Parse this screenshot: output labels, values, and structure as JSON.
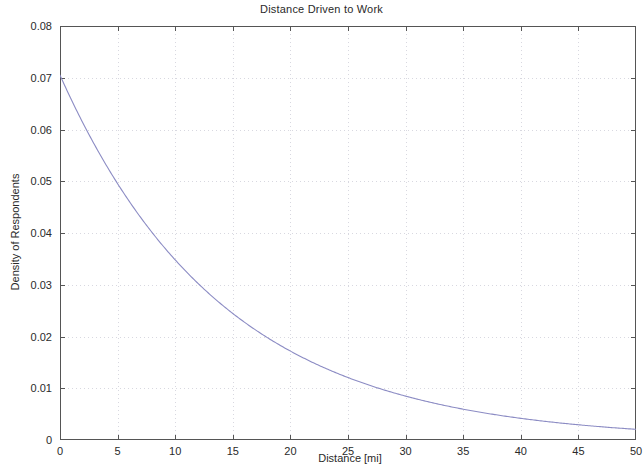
{
  "chart_data": {
    "type": "line",
    "title": "Distance Driven to Work",
    "xlabel": "Distance [mi]",
    "ylabel": "Density of Respondents",
    "xlim": [
      0,
      50
    ],
    "ylim": [
      0,
      0.08
    ],
    "xticks": [
      0,
      5,
      10,
      15,
      20,
      25,
      30,
      35,
      40,
      45,
      50
    ],
    "xtick_labels": [
      "0",
      "5",
      "10",
      "15",
      "20",
      "25",
      "30",
      "35",
      "40",
      "45",
      "50"
    ],
    "yticks": [
      0,
      0.01,
      0.02,
      0.03,
      0.04,
      0.05,
      0.06,
      0.07,
      0.08
    ],
    "ytick_labels": [
      "0",
      "0.01",
      "0.02",
      "0.03",
      "0.04",
      "0.05",
      "0.06",
      "0.07",
      "0.08"
    ],
    "grid": true,
    "grid_style": "dotted",
    "legend": null,
    "line_color": "#8c8cc4",
    "grid_color": "#d8d8e0",
    "axis_color": "#555555",
    "background": "#ffffff",
    "series": [
      {
        "name": "Exponential density fit",
        "description": "Exponential probability density of commute distance, f(x) = 0.0705 * exp(-0.0706 x)",
        "amplitude": 0.0705,
        "decay_rate": 0.0706,
        "mean_distance": 14.2,
        "x": [
          0,
          1,
          2,
          3,
          4,
          5,
          6,
          7,
          8,
          9,
          10,
          11,
          12,
          13,
          14,
          15,
          16,
          17,
          18,
          19,
          20,
          21,
          22,
          23,
          24,
          25,
          26,
          27,
          28,
          29,
          30,
          31,
          32,
          33,
          34,
          35,
          36,
          37,
          38,
          39,
          40,
          41,
          42,
          43,
          44,
          45,
          46,
          47,
          48,
          49,
          50
        ],
        "values": [
          0.0705,
          0.0657,
          0.0612,
          0.057,
          0.0531,
          0.0495,
          0.0461,
          0.043,
          0.0401,
          0.0373,
          0.0348,
          0.0324,
          0.0302,
          0.0281,
          0.0262,
          0.0244,
          0.0228,
          0.0212,
          0.0198,
          0.0184,
          0.0172,
          0.016,
          0.0149,
          0.0139,
          0.0129,
          0.012,
          0.0112,
          0.0105,
          0.0097,
          0.0091,
          0.0085,
          0.0079,
          0.0074,
          0.0069,
          0.0064,
          0.006,
          0.0056,
          0.0052,
          0.0048,
          0.0045,
          0.0042,
          0.0039,
          0.0036,
          0.0034,
          0.0032,
          0.0029,
          0.0027,
          0.0026,
          0.0024,
          0.0022,
          0.0021
        ]
      }
    ]
  }
}
